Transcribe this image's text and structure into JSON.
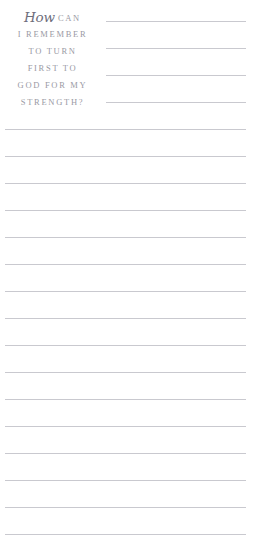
{
  "page": {
    "kind": "journal-prompt-page",
    "background_color": "#ffffff",
    "rule_color": "#c9c9cf",
    "text_color": "#9a9aa4",
    "script_color": "#6e6e7c"
  },
  "prompt": {
    "script_word": "How",
    "lines": [
      {
        "script": "How",
        "caps": "CAN"
      },
      {
        "script": "",
        "caps": "I REMEMBER"
      },
      {
        "script": "",
        "caps": "TO TURN"
      },
      {
        "script": "",
        "caps": "FIRST TO"
      },
      {
        "script": "",
        "caps": "GOD FOR MY"
      },
      {
        "script": "",
        "caps": "STRENGTH?"
      }
    ],
    "full_text": "How can I remember to turn first to God for my strength?"
  },
  "writing_lines": {
    "short_rules": [
      {
        "y": 21
      },
      {
        "y": 48
      },
      {
        "y": 75
      },
      {
        "y": 102
      }
    ],
    "full_rules": [
      {
        "y": 129
      },
      {
        "y": 156
      },
      {
        "y": 183
      },
      {
        "y": 210
      },
      {
        "y": 237
      },
      {
        "y": 264
      },
      {
        "y": 291
      },
      {
        "y": 318
      },
      {
        "y": 345
      },
      {
        "y": 372
      },
      {
        "y": 399
      },
      {
        "y": 426
      },
      {
        "y": 453
      },
      {
        "y": 480
      },
      {
        "y": 507
      },
      {
        "y": 534
      }
    ]
  }
}
